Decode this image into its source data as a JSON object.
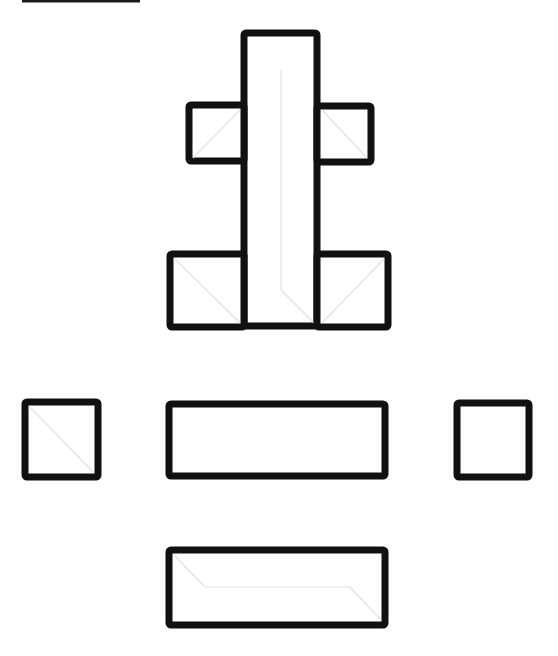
{
  "diagram": {
    "type": "flat-net",
    "background": "#ffffff",
    "stroke_color": "#111111",
    "fold_line_color": "#e2e2e2",
    "top_line": {
      "x1": 22,
      "y1": 1,
      "x2": 140,
      "y2": 1
    },
    "shapes": [
      {
        "name": "tall-center-panel",
        "x": 244,
        "y": 33,
        "w": 73,
        "h": 293,
        "folds": [
          [
            281,
            70,
            281,
            290
          ],
          [
            281,
            290,
            314,
            323
          ]
        ]
      },
      {
        "name": "upper-left-flap",
        "x": 189,
        "y": 105,
        "w": 55,
        "h": 56,
        "folds": [
          [
            193,
            158,
            240,
            110
          ]
        ]
      },
      {
        "name": "upper-right-flap",
        "x": 317,
        "y": 106,
        "w": 54,
        "h": 56,
        "folds": [
          [
            322,
            110,
            367,
            158
          ]
        ]
      },
      {
        "name": "lower-left-block",
        "x": 170,
        "y": 254,
        "w": 74,
        "h": 73,
        "folds": [
          [
            175,
            259,
            240,
            323
          ]
        ]
      },
      {
        "name": "lower-right-block",
        "x": 317,
        "y": 254,
        "w": 71,
        "h": 73,
        "folds": [
          [
            384,
            259,
            322,
            323
          ]
        ]
      },
      {
        "name": "left-square",
        "x": 25,
        "y": 402,
        "w": 73,
        "h": 75,
        "folds": [
          [
            30,
            407,
            93,
            472
          ]
        ]
      },
      {
        "name": "middle-rectangle",
        "x": 169,
        "y": 404,
        "w": 216,
        "h": 72,
        "folds": []
      },
      {
        "name": "right-square",
        "x": 457,
        "y": 403,
        "w": 72,
        "h": 74,
        "folds": []
      },
      {
        "name": "bottom-rectangle",
        "x": 169,
        "y": 550,
        "w": 216,
        "h": 75,
        "folds": [
          [
            174,
            555,
            205,
            587
          ],
          [
            205,
            587,
            350,
            587
          ],
          [
            350,
            587,
            381,
            620
          ]
        ]
      }
    ]
  }
}
